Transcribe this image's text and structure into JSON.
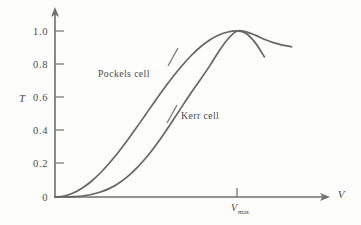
{
  "chart_data": {
    "type": "line",
    "title": "",
    "xlabel": "V",
    "ylabel": "T",
    "grid": false,
    "legend_position": "inline-annotation",
    "xlim": [
      0,
      1.45
    ],
    "ylim": [
      0,
      1.12
    ],
    "yticks": [
      "0",
      "0.2",
      "0.4",
      "0.6",
      "0.8",
      "1.0"
    ],
    "ytick_values": [
      0,
      0.2,
      0.4,
      0.6,
      0.8,
      1.0
    ],
    "xticks": [
      "V_max"
    ],
    "xtick_values": [
      1.0
    ],
    "xtick_label_main": "V",
    "xtick_label_sub": "max",
    "annotations": [
      {
        "text": "Pockels cell",
        "x": 0.33,
        "y": 0.8
      },
      {
        "text": "Kerr cell",
        "x": 0.7,
        "y": 0.56
      }
    ],
    "series": [
      {
        "name": "Pockels cell",
        "x": [
          0.0,
          0.05,
          0.1,
          0.15,
          0.2,
          0.25,
          0.3,
          0.35,
          0.4,
          0.45,
          0.5,
          0.55,
          0.6,
          0.65,
          0.7,
          0.75,
          0.8,
          0.85,
          0.9,
          0.95,
          1.0,
          1.05,
          1.1,
          1.15
        ],
        "y": [
          0.0,
          0.006,
          0.024,
          0.054,
          0.095,
          0.146,
          0.206,
          0.273,
          0.345,
          0.421,
          0.5,
          0.579,
          0.655,
          0.727,
          0.794,
          0.854,
          0.905,
          0.946,
          0.976,
          0.994,
          1.0,
          0.985,
          0.93,
          0.845
        ]
      },
      {
        "name": "Kerr cell",
        "x": [
          0.0,
          0.05,
          0.1,
          0.15,
          0.2,
          0.25,
          0.3,
          0.35,
          0.4,
          0.45,
          0.5,
          0.55,
          0.6,
          0.65,
          0.7,
          0.75,
          0.8,
          0.85,
          0.9,
          0.95,
          1.0,
          1.05,
          1.1,
          1.15,
          1.2,
          1.25,
          1.3
        ],
        "y": [
          0.0,
          0.0,
          0.002,
          0.006,
          0.015,
          0.03,
          0.052,
          0.083,
          0.124,
          0.175,
          0.236,
          0.306,
          0.383,
          0.465,
          0.549,
          0.631,
          0.709,
          0.79,
          0.877,
          0.952,
          1.0,
          0.995,
          0.975,
          0.95,
          0.93,
          0.915,
          0.905
        ]
      }
    ]
  },
  "figure": {
    "y_axis_name": "T",
    "x_axis_name": "V",
    "y_labels": [
      "1.0",
      "0.8",
      "0.6",
      "0.4",
      "0.2",
      "0"
    ],
    "origin_label": "0",
    "vmax_main": "V",
    "vmax_sub": "max",
    "pockels_label": "Pockels cell",
    "kerr_label": "Kerr cell"
  },
  "colors": {
    "background": "#fdfdfb",
    "axis": "#6f6f6f",
    "curve": "#666666",
    "text": "#4a4a4a"
  }
}
